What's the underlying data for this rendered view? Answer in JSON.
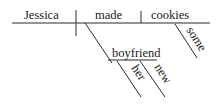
{
  "diagram": {
    "type": "sentence-diagram",
    "sentence": "Jessica made her new boyfriend some cookies",
    "subject": "Jessica",
    "verb": "made",
    "direct_object": "cookies",
    "object_modifier": "some",
    "indirect_object": "boyfriend",
    "indirect_object_modifiers": [
      "her",
      "new"
    ],
    "colors": {
      "ink": "#1a1a1a",
      "background": "#ffffff"
    }
  }
}
